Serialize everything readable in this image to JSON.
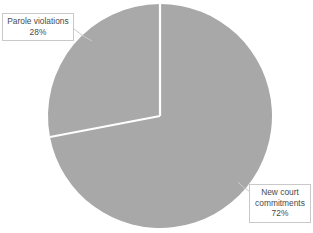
{
  "chart_data": {
    "type": "pie",
    "title": "",
    "subtitle": "",
    "xlabel": "",
    "ylabel": "",
    "grid": false,
    "legend_position": "none",
    "labels_position": "callout-outside",
    "start_angle_deg": 0,
    "direction": "clockwise",
    "categories": [
      "New court commitments",
      "Parole violations"
    ],
    "values": [
      72,
      28
    ],
    "value_unit": "%",
    "slices": [
      {
        "name": "New court commitments",
        "value": 72,
        "label_text": "New court commitments",
        "value_text": "72%",
        "color": "#a8a8a8",
        "start_angle_deg": 0,
        "end_angle_deg": 259.2
      },
      {
        "name": "Parole violations",
        "value": 28,
        "label_text": "Parole violations",
        "value_text": "28%",
        "color": "#a9a9a9",
        "start_angle_deg": 259.2,
        "end_angle_deg": 360
      }
    ],
    "annotations": []
  },
  "callouts": {
    "parole": {
      "line1": "Parole violations",
      "line2": "28%"
    },
    "new_court": {
      "line1": "New court",
      "line2": "commitments",
      "line3": "72%"
    }
  },
  "colors": {
    "background": "#ffffff",
    "slice_new_court": "#a8a8a8",
    "slice_parole": "#a9a9a9",
    "slice_divider": "#ffffff",
    "callout_border": "#c9c9c9",
    "callout_fill": "#ffffff",
    "text": "#4a4a4a",
    "leader_line": "#c9c9c9"
  }
}
